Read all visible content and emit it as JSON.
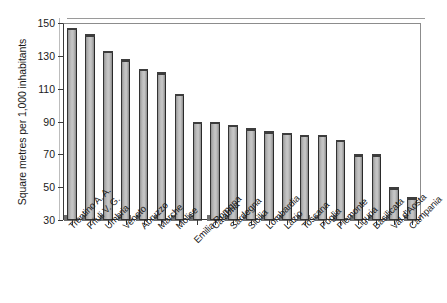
{
  "chart_data": {
    "type": "bar",
    "title": "",
    "xlabel": "",
    "ylabel": "Square metres per 1,000 inhabitants",
    "ylim": [
      30,
      150
    ],
    "yticks": [
      30,
      50,
      70,
      90,
      110,
      130,
      150
    ],
    "grid": false,
    "legend": false,
    "bar_color": "#bdbdbd",
    "bar_edge_color": "#333333",
    "categories": [
      "Trentino A. A.",
      "Friuli V. G.",
      "Umbria",
      "Veneto",
      "Abruzzo",
      "Marche",
      "Molise",
      "Emilia Romgna",
      "Calabria",
      "Sardegna",
      "Sicilia",
      "Lombardia",
      "Lazio",
      "Toscana",
      "Puglia",
      "Piemonte",
      "Liguria",
      "Basilicata",
      "Val d'Aosta",
      "Campania"
    ],
    "values": [
      147,
      143,
      133,
      128,
      122,
      120,
      107,
      90,
      90,
      88,
      86,
      84,
      83,
      82,
      82,
      79,
      70,
      70,
      50,
      44
    ]
  },
  "axis": {
    "y_title": "Square metres per 1,000 inhabitants",
    "y_tick_labels": [
      "150",
      "130",
      "110",
      "90",
      "70",
      "50",
      "30"
    ]
  }
}
